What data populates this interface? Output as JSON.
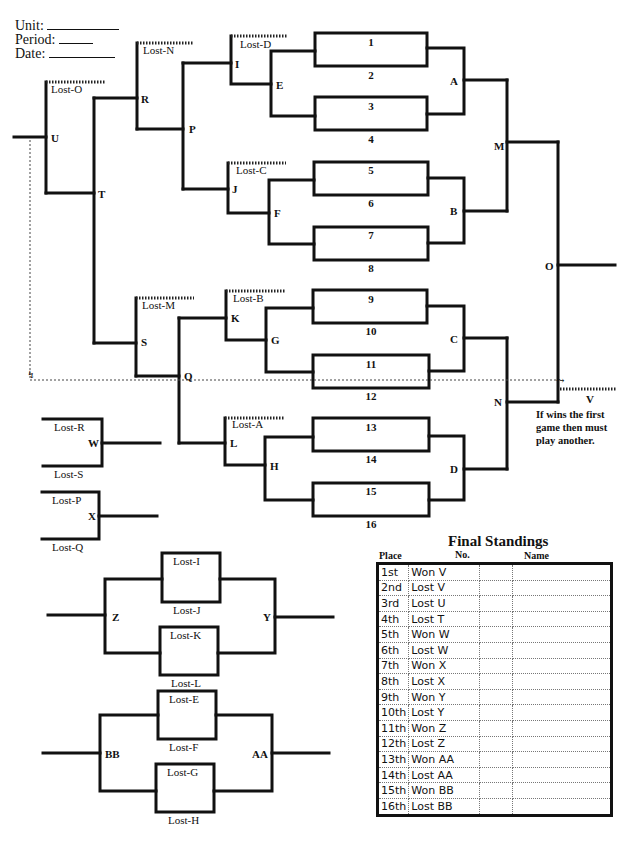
{
  "header": {
    "unit_label": "Unit:",
    "period_label": "Period:",
    "date_label": "Date:"
  },
  "bracket": {
    "first_round_slots": [
      "1",
      "2",
      "3",
      "4",
      "5",
      "6",
      "7",
      "8",
      "9",
      "10",
      "11",
      "12",
      "13",
      "14",
      "15",
      "16"
    ],
    "winners_nodes": {
      "A": "A",
      "B": "B",
      "C": "C",
      "D": "D",
      "M": "M",
      "N": "N",
      "O": "O"
    },
    "losers_nodes": {
      "E": "E",
      "F": "F",
      "G": "G",
      "H": "H",
      "I": "I",
      "J": "J",
      "K": "K",
      "L": "L",
      "P": "P",
      "Q": "Q",
      "R": "R",
      "S": "S",
      "T": "T",
      "U": "U"
    },
    "loser_entry_labels": {
      "lost_d": "Lost-D",
      "lost_c": "Lost-C",
      "lost_b": "Lost-B",
      "lost_a": "Lost-A",
      "lost_n": "Lost-N",
      "lost_m": "Lost-M",
      "lost_o": "Lost-O"
    },
    "final": {
      "v_label": "V",
      "note": [
        "If wins the first",
        "game then must",
        "play another."
      ]
    }
  },
  "consolation": {
    "w": {
      "node": "W",
      "top": "Lost-R",
      "bottom": "Lost-S"
    },
    "x": {
      "node": "X",
      "top": "Lost-P",
      "bottom": "Lost-Q"
    },
    "zy": {
      "left_node": "Z",
      "right_node": "Y",
      "box1_top": "Lost-I",
      "box1_bottom": "Lost-J",
      "box2_top": "Lost-K",
      "box2_bottom": "Lost-L"
    },
    "bbaa": {
      "left_node": "BB",
      "right_node": "AA",
      "box1_top": "Lost-E",
      "box1_bottom": "Lost-F",
      "box2_top": "Lost-G",
      "box2_bottom": "Lost-H"
    }
  },
  "final_standings": {
    "title": "Final  Standings",
    "columns": {
      "place": "Place",
      "no": "No.",
      "name": "Name"
    },
    "rows": [
      {
        "place": "1st",
        "result": "Won V",
        "no": "",
        "name": ""
      },
      {
        "place": "2nd",
        "result": "Lost V",
        "no": "",
        "name": ""
      },
      {
        "place": "3rd",
        "result": "Lost U",
        "no": "",
        "name": ""
      },
      {
        "place": "4th",
        "result": "Lost T",
        "no": "",
        "name": ""
      },
      {
        "place": "5th",
        "result": "Won W",
        "no": "",
        "name": ""
      },
      {
        "place": "6th",
        "result": "Lost W",
        "no": "",
        "name": ""
      },
      {
        "place": "7th",
        "result": "Won X",
        "no": "",
        "name": ""
      },
      {
        "place": "8th",
        "result": "Lost X",
        "no": "",
        "name": ""
      },
      {
        "place": "9th",
        "result": "Won Y",
        "no": "",
        "name": ""
      },
      {
        "place": "10th",
        "result": "Lost Y",
        "no": "",
        "name": ""
      },
      {
        "place": "11th",
        "result": "Won Z",
        "no": "",
        "name": ""
      },
      {
        "place": "12th",
        "result": "Lost Z",
        "no": "",
        "name": ""
      },
      {
        "place": "13th",
        "result": "Won AA",
        "no": "",
        "name": ""
      },
      {
        "place": "14th",
        "result": "Lost AA",
        "no": "",
        "name": ""
      },
      {
        "place": "15th",
        "result": "Won BB",
        "no": "",
        "name": ""
      },
      {
        "place": "16th",
        "result": "Lost BB",
        "no": "",
        "name": ""
      }
    ]
  }
}
